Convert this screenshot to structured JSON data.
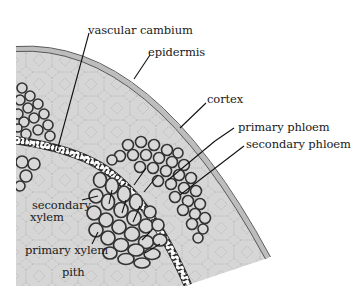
{
  "figure": {
    "colors": {
      "background": "#ffffff",
      "tissue_fill": "#d6d6d6",
      "cell_outline": "#a9a9a9",
      "epidermis": "#bdbdbd",
      "epidermis_edge": "#4a4a4a",
      "vascular_cell": "#3a3a3a",
      "cambium_cell": "#ffffff",
      "leader_line": "#111111",
      "text": "#1a1a1a"
    },
    "labels": [
      {
        "id": "vascular-cambium",
        "text": "vascular cambium"
      },
      {
        "id": "epidermis",
        "text": "epidermis"
      },
      {
        "id": "cortex",
        "text": "cortex"
      },
      {
        "id": "primary-phloem",
        "text": "primary phloem"
      },
      {
        "id": "secondary-phloem",
        "text": "secondary phloem"
      },
      {
        "id": "secondary-xylem",
        "text": "secondary xylem",
        "line1": "secondary",
        "line2": "xylem"
      },
      {
        "id": "primary-xylem",
        "text": "primary xylem"
      },
      {
        "id": "pith",
        "text": "pith"
      }
    ]
  }
}
